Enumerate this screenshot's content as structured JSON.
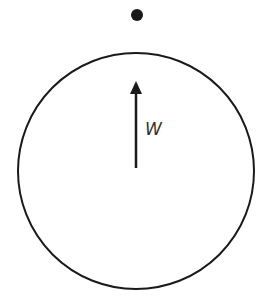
{
  "diagram": {
    "type": "free-body-diagram",
    "colors": {
      "stroke": "#1a1a1a",
      "dot": "#1a1a1a",
      "label": "#333333",
      "background": "#ffffff"
    },
    "dot": {
      "cx": 137,
      "cy": 15,
      "r": 6
    },
    "circle": {
      "cx": 136,
      "cy": 171,
      "r": 118
    },
    "arrow": {
      "x": 136,
      "y_start": 168,
      "y_end": 82,
      "direction": "up",
      "label": "W"
    }
  }
}
